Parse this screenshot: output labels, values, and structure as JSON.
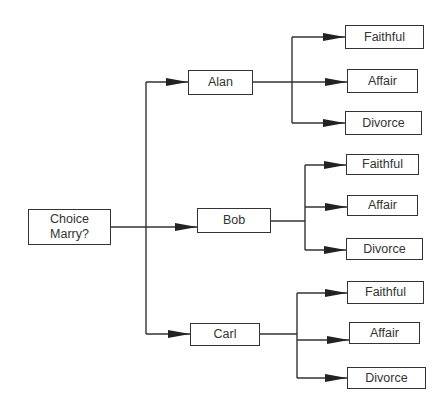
{
  "diagram": {
    "type": "decision-tree",
    "root": {
      "line1": "Choice",
      "line2": "Marry?"
    },
    "choices": [
      {
        "label": "Alan",
        "outcomes": [
          "Faithful",
          "Affair",
          "Divorce"
        ]
      },
      {
        "label": "Bob",
        "outcomes": [
          "Faithful",
          "Affair",
          "Divorce"
        ]
      },
      {
        "label": "Carl",
        "outcomes": [
          "Faithful",
          "Affair",
          "Divorce"
        ]
      }
    ]
  },
  "colors": {
    "line": "#333333",
    "background": "#ffffff"
  }
}
